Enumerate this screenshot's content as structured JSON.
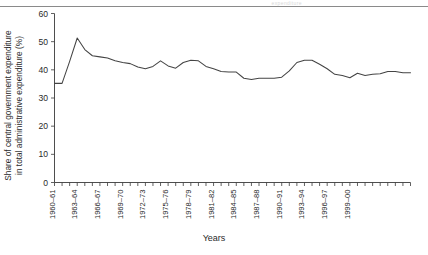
{
  "figure": {
    "scan_artifact_text": "expenditure",
    "background_color": "#ffffff"
  },
  "chart_data": {
    "type": "line",
    "title": "",
    "subtitle": "",
    "xlabel": "Years",
    "ylabel": "Share of central government expenditure\nin total administrative expenditure (%)",
    "xlim": [
      0,
      40
    ],
    "ylim": [
      0,
      60
    ],
    "grid": false,
    "legend": null,
    "line_color": "#444444",
    "y_ticks": [
      0,
      10,
      20,
      30,
      40,
      50,
      60
    ],
    "y_tick_labels": [
      "0",
      "10",
      "20",
      "30",
      "40",
      "50",
      "60"
    ],
    "x_tick_labels": [
      "1960–61",
      "1963–64",
      "1966–67",
      "1969–70",
      "1972–73",
      "1975–76",
      "1978–79",
      "1981–82",
      "1984–85",
      "1987–88",
      "1990–91",
      "1993–94",
      "1996–97",
      "1999–00"
    ],
    "categories": [
      "1960–61",
      "1961–62",
      "1962–63",
      "1963–64",
      "1964–65",
      "1965–66",
      "1966–67",
      "1967–68",
      "1968–69",
      "1969–70",
      "1970–71",
      "1971–72",
      "1972–73",
      "1973–74",
      "1974–75",
      "1975–76",
      "1976–77",
      "1977–78",
      "1978–79",
      "1979–80",
      "1980–81",
      "1981–82",
      "1982–83",
      "1983–84",
      "1984–85",
      "1985–86",
      "1986–87",
      "1987–88",
      "1988–89",
      "1989–90",
      "1990–91",
      "1991–92",
      "1992–93",
      "1993–94",
      "1994–95",
      "1995–96",
      "1996–97",
      "1997–98",
      "1998–99",
      "1999–00",
      "2000–01"
    ],
    "values": [
      35.2,
      35.2,
      43.0,
      51.3,
      47.2,
      45.0,
      44.6,
      44.2,
      43.2,
      42.6,
      42.2,
      41.0,
      40.4,
      41.2,
      43.2,
      41.4,
      40.6,
      42.6,
      43.4,
      43.2,
      41.2,
      40.4,
      39.4,
      39.2,
      39.2,
      37.0,
      36.6,
      37.0,
      37.0,
      37.0,
      37.4,
      39.6,
      42.6,
      43.4,
      43.4,
      42.0,
      40.4,
      38.4,
      38.0,
      37.2,
      38.8
    ],
    "values_tail": [
      38.0,
      38.4,
      38.6,
      39.4,
      39.4,
      39.0,
      39.0
    ],
    "series": [
      {
        "name": "Share of central government expenditure in total administrative expenditure (%)",
        "color": "#444444"
      }
    ]
  }
}
